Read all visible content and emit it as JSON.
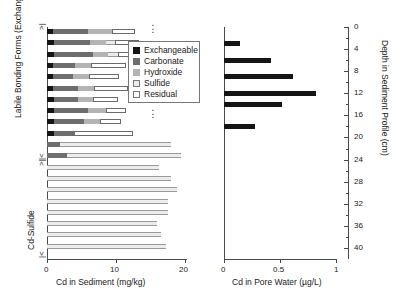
{
  "chart_data": {
    "type": "bar",
    "title": "",
    "panels": [
      {
        "name": "sediment-panel",
        "type": "bar",
        "orientation": "horizontal",
        "stacked": true,
        "xlabel": "Cd in Sediment (mg/kg)",
        "xlim": [
          0,
          22
        ],
        "xticks": [
          0,
          10,
          20
        ],
        "xticklabels": [
          "0",
          "10",
          "20"
        ],
        "ylabel_groups": [
          "Labile Bonding Forms (Exchangeable, Carbonate)",
          "Cd-Sulfide"
        ],
        "series": [
          {
            "name": "Exchangeable",
            "color": "#151515"
          },
          {
            "name": "Carbonate",
            "color": "#6e6e6e"
          },
          {
            "name": "Hydroxide",
            "color": "#b4b4b4"
          },
          {
            "name": "Sulfide",
            "color": "#ececec"
          },
          {
            "name": "Residual",
            "color": "#ffffff"
          }
        ],
        "rows": [
          {
            "exchangeable": 0.9,
            "carbonate": 5.0,
            "hydroxide": 3.5,
            "sulfide": 0.0,
            "residual": 3.3
          },
          {
            "exchangeable": 1.0,
            "carbonate": 5.2,
            "hydroxide": 2.4,
            "sulfide": 1.3,
            "residual": 3.4
          },
          {
            "exchangeable": 1.0,
            "carbonate": 5.6,
            "hydroxide": 2.2,
            "sulfide": 1.5,
            "residual": 3.4
          },
          {
            "exchangeable": 0.9,
            "carbonate": 3.1,
            "hydroxide": 2.4,
            "sulfide": 0.0,
            "residual": 5.0
          },
          {
            "exchangeable": 0.9,
            "carbonate": 2.9,
            "hydroxide": 2.3,
            "sulfide": 0.0,
            "residual": 4.3
          },
          {
            "exchangeable": 0.9,
            "carbonate": 3.6,
            "hydroxide": 2.3,
            "sulfide": 0.0,
            "residual": 5.0
          },
          {
            "exchangeable": 1.0,
            "carbonate": 3.5,
            "hydroxide": 2.2,
            "sulfide": 0.0,
            "residual": 3.6
          },
          {
            "exchangeable": 1.0,
            "carbonate": 5.0,
            "hydroxide": 2.6,
            "sulfide": 0.0,
            "residual": 2.9
          },
          {
            "exchangeable": 1.0,
            "carbonate": 4.4,
            "hydroxide": 2.3,
            "sulfide": 0.0,
            "residual": 3.0
          },
          {
            "exchangeable": 1.0,
            "carbonate": 2.9,
            "hydroxide": 0.0,
            "sulfide": 0.0,
            "residual": 8.6
          },
          {
            "exchangeable": 0.0,
            "carbonate": 1.9,
            "hydroxide": 0.0,
            "sulfide": 16.0,
            "residual": 0.0
          },
          {
            "exchangeable": 0.0,
            "carbonate": 2.9,
            "hydroxide": 0.0,
            "sulfide": 16.5,
            "residual": 0.0
          },
          {
            "exchangeable": 0.0,
            "carbonate": 0.0,
            "hydroxide": 0.0,
            "sulfide": 16.2,
            "residual": 0.0
          },
          {
            "exchangeable": 0.0,
            "carbonate": 0.0,
            "hydroxide": 0.0,
            "sulfide": 18.0,
            "residual": 0.0
          },
          {
            "exchangeable": 0.0,
            "carbonate": 0.0,
            "hydroxide": 0.0,
            "sulfide": 18.8,
            "residual": 0.0
          },
          {
            "exchangeable": 0.0,
            "carbonate": 0.0,
            "hydroxide": 0.0,
            "sulfide": 17.6,
            "residual": 0.0
          },
          {
            "exchangeable": 0.0,
            "carbonate": 0.0,
            "hydroxide": 0.0,
            "sulfide": 17.5,
            "residual": 0.0
          },
          {
            "exchangeable": 0.0,
            "carbonate": 0.0,
            "hydroxide": 0.0,
            "sulfide": 15.9,
            "residual": 0.0
          },
          {
            "exchangeable": 0.0,
            "carbonate": 0.0,
            "hydroxide": 0.0,
            "sulfide": 16.5,
            "residual": 0.0
          },
          {
            "exchangeable": 0.0,
            "carbonate": 0.0,
            "hydroxide": 0.0,
            "sulfide": 17.3,
            "residual": 0.0
          }
        ]
      },
      {
        "name": "pore-water-panel",
        "type": "bar",
        "orientation": "horizontal",
        "stacked": false,
        "xlabel": "Cd in Pore Water (µg/L)",
        "xlim": [
          0,
          1
        ],
        "xticks": [
          0,
          0.5,
          1
        ],
        "xticklabels": [
          "0",
          "0.5",
          "1"
        ],
        "ylabel": "Depth in Sediment Profile (cm)",
        "ylim": [
          0,
          42
        ],
        "yticks": [
          0,
          4,
          8,
          12,
          16,
          20,
          24,
          28,
          32,
          36,
          40
        ],
        "yticklabels": [
          "0",
          "4",
          "8",
          "12",
          "16",
          "20",
          "24",
          "28",
          "32",
          "36",
          "40"
        ],
        "bar_color": "#151515",
        "values": [
          0.14,
          0.42,
          0.62,
          0.82,
          0.52,
          0.28
        ],
        "depths": [
          3,
          6,
          9,
          12,
          14,
          18
        ]
      }
    ],
    "legend": {
      "position": "inside-upper-right-of-left-panel",
      "entries": [
        {
          "label": "Exchangeable",
          "color": "#151515"
        },
        {
          "label": "Carbonate",
          "color": "#6e6e6e"
        },
        {
          "label": "Hydroxide",
          "color": "#b4b4b4"
        },
        {
          "label": "Sulfide",
          "color": "#ececec"
        },
        {
          "label": "Residual",
          "color": "#ffffff"
        }
      ]
    },
    "annotations": {
      "bracket_upper": "Labile Bonding Forms (Exchangeable, Carbonate)",
      "bracket_lower": "Cd-Sulfide",
      "ellipsis_marks": 2
    }
  }
}
